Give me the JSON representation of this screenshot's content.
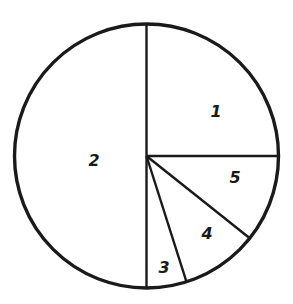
{
  "chart_data": {
    "type": "pie",
    "title": "",
    "start_angle_deg": 0,
    "direction": "clockwise",
    "categories": [
      "1",
      "5",
      "4",
      "3",
      "2"
    ],
    "values": [
      25,
      10.7,
      9.4,
      4.9,
      50
    ],
    "slices": [
      {
        "label": "1",
        "value": 25,
        "label_pos": [
          216,
          112
        ]
      },
      {
        "label": "5",
        "value": 10.7,
        "label_pos": [
          235,
          178
        ]
      },
      {
        "label": "4",
        "value": 9.4,
        "label_pos": [
          207,
          234
        ]
      },
      {
        "label": "3",
        "value": 4.9,
        "label_pos": [
          164,
          268
        ]
      },
      {
        "label": "2",
        "value": 50,
        "label_pos": [
          94,
          161
        ]
      }
    ],
    "legend": "none",
    "grid": false,
    "colors": {
      "line": "#1a1a1a",
      "fill": "#ffffff"
    }
  }
}
